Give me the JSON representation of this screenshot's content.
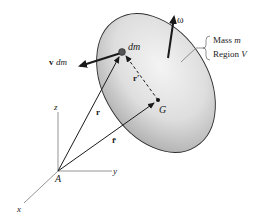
{
  "figure": {
    "body": {
      "mass_label_prefix": "Mass ",
      "mass_symbol": "m",
      "region_label_prefix": "Region ",
      "region_symbol": "V"
    },
    "points": {
      "element": "dm",
      "center_of_mass": "G",
      "origin": "A"
    },
    "vectors": {
      "velocity_bold": "v",
      "velocity_rest": "dm",
      "angular_velocity": "ω",
      "position": "r",
      "position_cm": "r̄",
      "relative_position": "r′"
    },
    "axes": {
      "x": "x",
      "y": "y",
      "z": "z"
    }
  }
}
